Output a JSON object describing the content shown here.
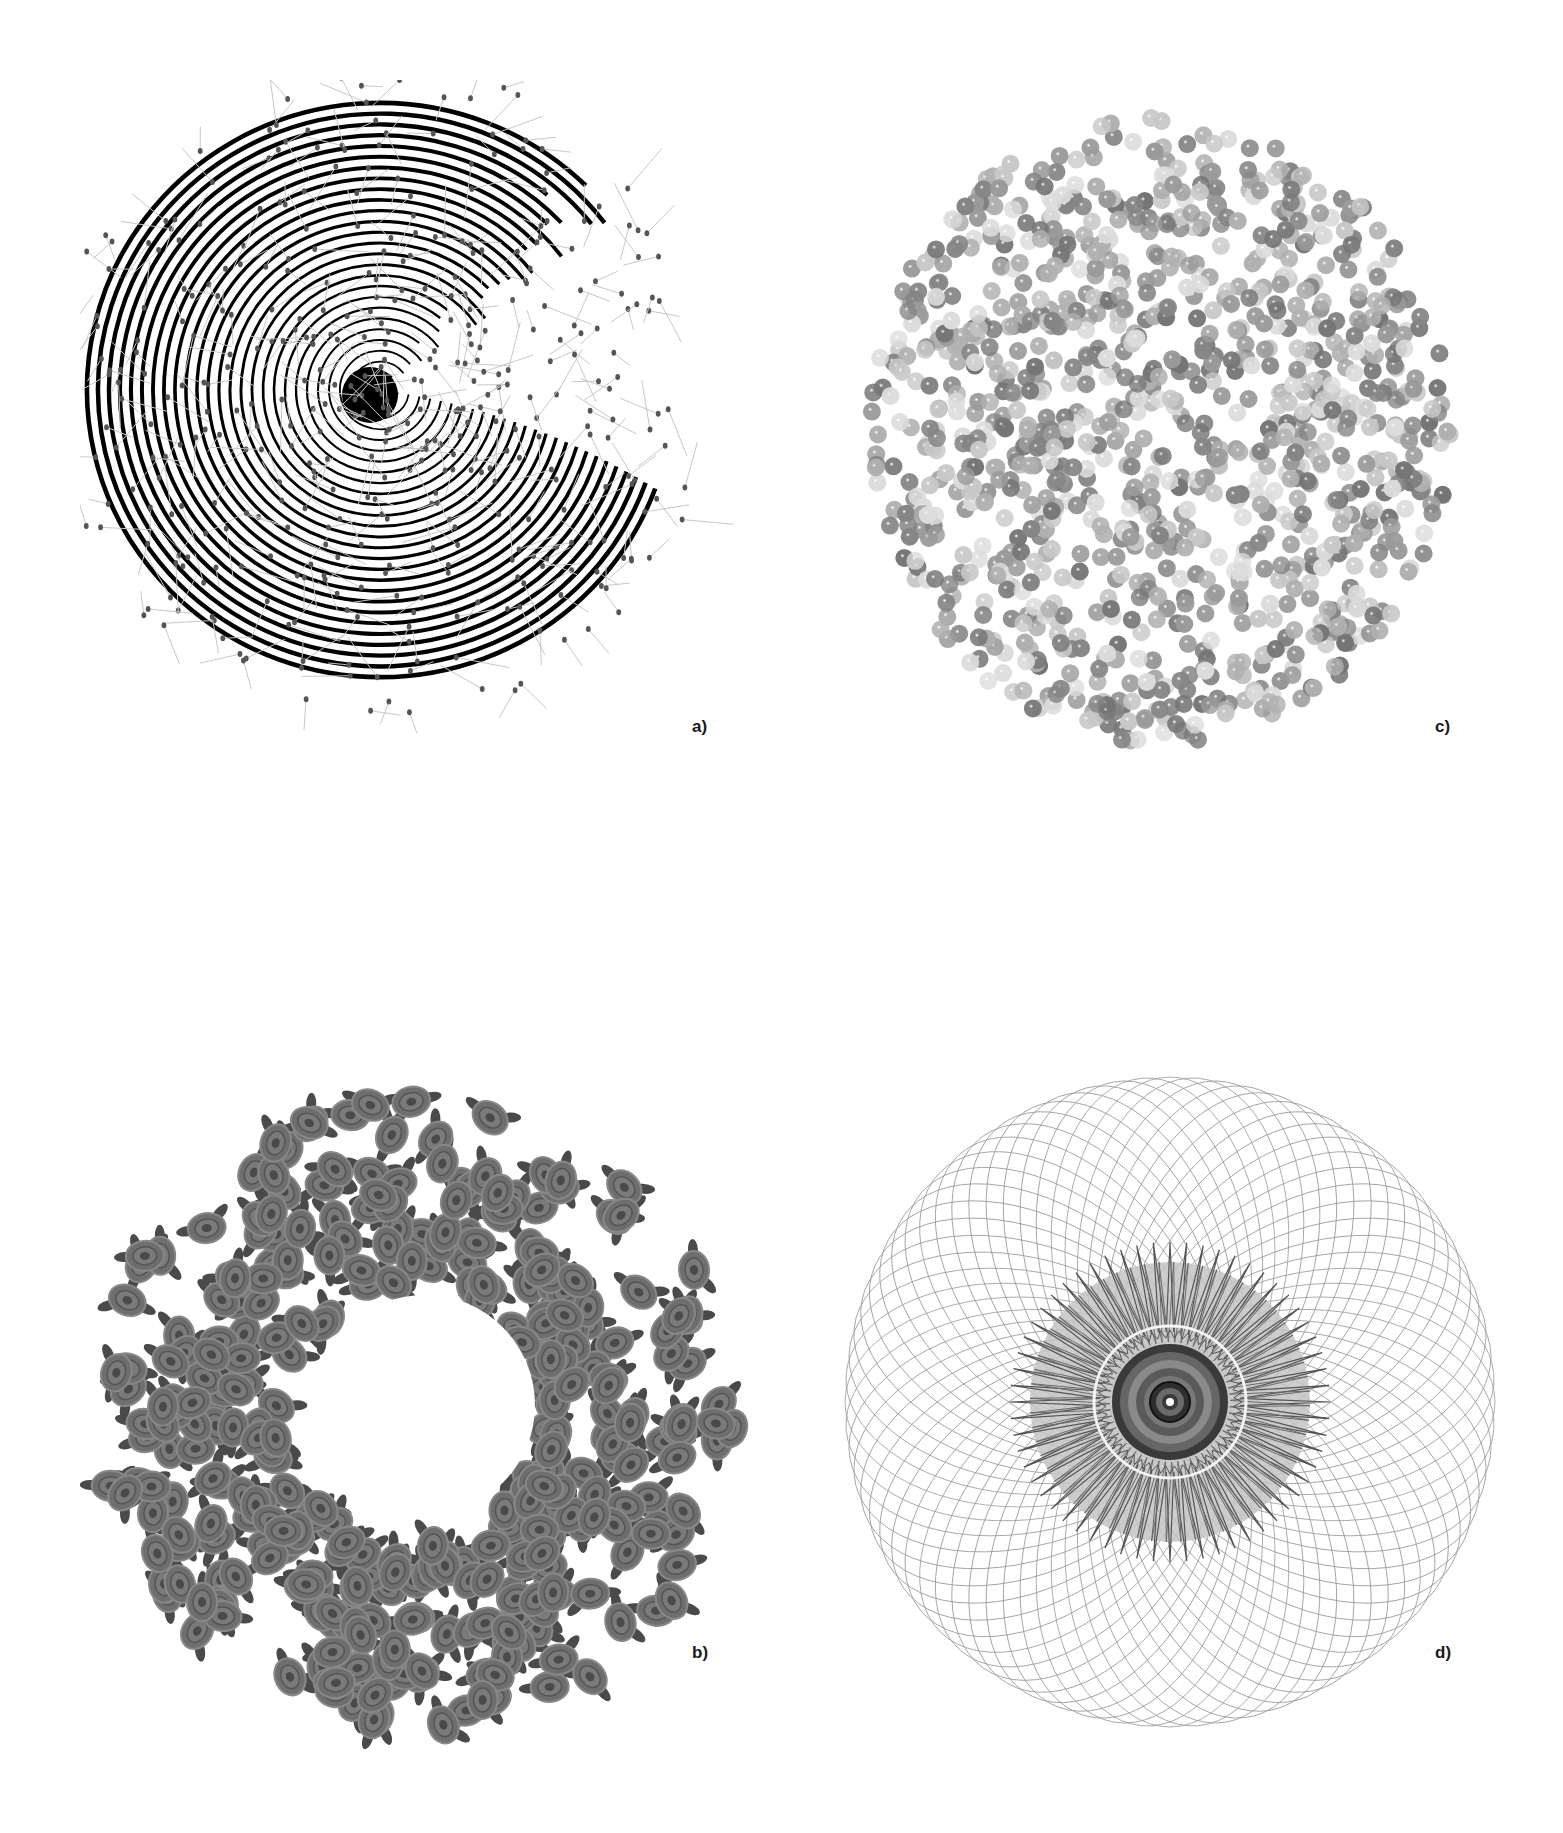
{
  "figure": {
    "panels": [
      {
        "id": "a",
        "label": "a)",
        "description": "Spiral of concentric black arcs with scattered grey dots and light grey line segments (pin-like particles)",
        "colors": {
          "arcs": "#000000",
          "dots": "#555555",
          "lines": "#c8c8c8"
        }
      },
      {
        "id": "c",
        "label": "c)",
        "description": "Circular cloud of overlapping glossy grey spheres in varying shades",
        "colors": {
          "light": "#d8d8d8",
          "mid": "#a0a0a0",
          "dark": "#6a6a6a"
        }
      },
      {
        "id": "b",
        "label": "b)",
        "description": "Ring/wreath composed of many grey rose blossoms with leaves and a white hollow center",
        "colors": {
          "rose": "#6e6e6e",
          "leaf": "#4a4a4a"
        }
      },
      {
        "id": "d",
        "label": "d)",
        "description": "Spirograph pattern of overlapping grey ellipses with a dark star burst and concentric ringed center",
        "colors": {
          "lines": "#999999",
          "center_fill": "#c4c4c4",
          "star": "#555555",
          "core": "#3a3a3a"
        }
      }
    ]
  }
}
